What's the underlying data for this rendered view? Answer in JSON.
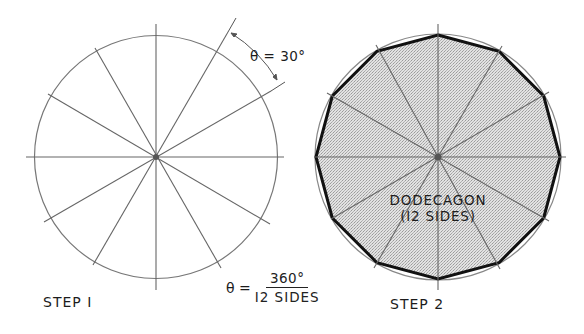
{
  "figure": {
    "step1": {
      "label": "STEP I",
      "angle_label": "θ = 30°",
      "divisions": 12
    },
    "step2": {
      "label": "STEP 2",
      "polygon_name": "DODECAGON",
      "polygon_sides_label": "(I2 SIDES)"
    },
    "formula": {
      "lhs": "θ =",
      "numerator": "360°",
      "denominator": "I2 SIDES"
    },
    "colors": {
      "line": "#6e6e6e",
      "polygon_edge": "#111111",
      "fill": "#d9d9d9"
    }
  }
}
